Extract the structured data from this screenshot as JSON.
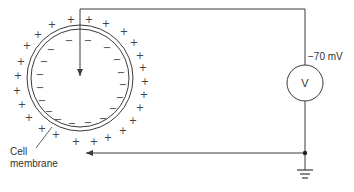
{
  "diagram": {
    "type": "membrane-potential-measurement",
    "colors": {
      "line": "#3a3a3a",
      "text": "#333333",
      "background": "#ffffff"
    },
    "cell": {
      "center": [
        80,
        78
      ],
      "outer_radius": 53,
      "inner_radius": 49,
      "label_line1": "Cell",
      "label_line2": "membrane",
      "outside_charge": "+",
      "inside_charge": "−"
    },
    "voltmeter": {
      "symbol": "V",
      "reading": "−70 mV",
      "center": [
        305,
        83
      ],
      "radius": 18
    },
    "electrodes": {
      "intracellular": "arrow into cell center",
      "extracellular": "arrow at cell exterior"
    },
    "ground": {
      "symbol": "ground"
    },
    "plus_positions": [
      [
        52,
        24
      ],
      [
        71,
        19
      ],
      [
        89,
        19
      ],
      [
        106,
        23
      ],
      [
        124,
        31
      ],
      [
        38,
        34
      ],
      [
        134,
        42
      ],
      [
        27,
        45
      ],
      [
        140,
        55
      ],
      [
        21,
        61
      ],
      [
        143,
        67
      ],
      [
        18,
        75
      ],
      [
        145,
        81
      ],
      [
        17,
        90
      ],
      [
        144,
        94
      ],
      [
        22,
        104
      ],
      [
        140,
        107
      ],
      [
        29,
        117
      ],
      [
        133,
        120
      ],
      [
        42,
        128
      ],
      [
        123,
        130
      ],
      [
        56,
        134
      ],
      [
        108,
        137
      ],
      [
        76,
        141
      ],
      [
        94,
        141
      ]
    ],
    "minus_positions": [
      [
        69,
        40
      ],
      [
        88,
        40
      ],
      [
        107,
        47
      ],
      [
        51,
        49
      ],
      [
        117,
        59
      ],
      [
        44,
        61
      ],
      [
        121,
        72
      ],
      [
        40,
        74
      ],
      [
        123,
        84
      ],
      [
        40,
        87
      ],
      [
        120,
        97
      ],
      [
        42,
        100
      ],
      [
        113,
        108
      ],
      [
        49,
        111
      ],
      [
        103,
        118
      ],
      [
        58,
        119
      ],
      [
        88,
        122
      ],
      [
        72,
        123
      ]
    ]
  }
}
